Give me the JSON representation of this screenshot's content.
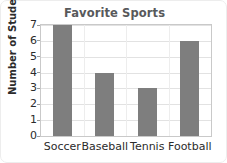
{
  "chart_data": {
    "type": "bar",
    "title": "Favorite Sports",
    "xlabel": "",
    "ylabel": "Number of Students",
    "categories": [
      "Soccer",
      "Baseball",
      "Tennis",
      "Football"
    ],
    "values": [
      7,
      4,
      3,
      6
    ],
    "ylim": [
      0,
      7
    ],
    "ytick_labels": [
      "0",
      "1",
      "2",
      "3",
      "4",
      "5",
      "6",
      "7"
    ],
    "ytick_values": [
      0,
      1,
      2,
      3,
      4,
      5,
      6,
      7
    ],
    "grid": true,
    "legend": false,
    "colors": {
      "bar": "#7e7e7e",
      "title": "#58595b",
      "axis_text": "#2b2b2b",
      "gridline": "#e2e2e2",
      "plot_border": "#c9c9c9",
      "card_border": "#ededed",
      "background": "#ffffff"
    }
  }
}
